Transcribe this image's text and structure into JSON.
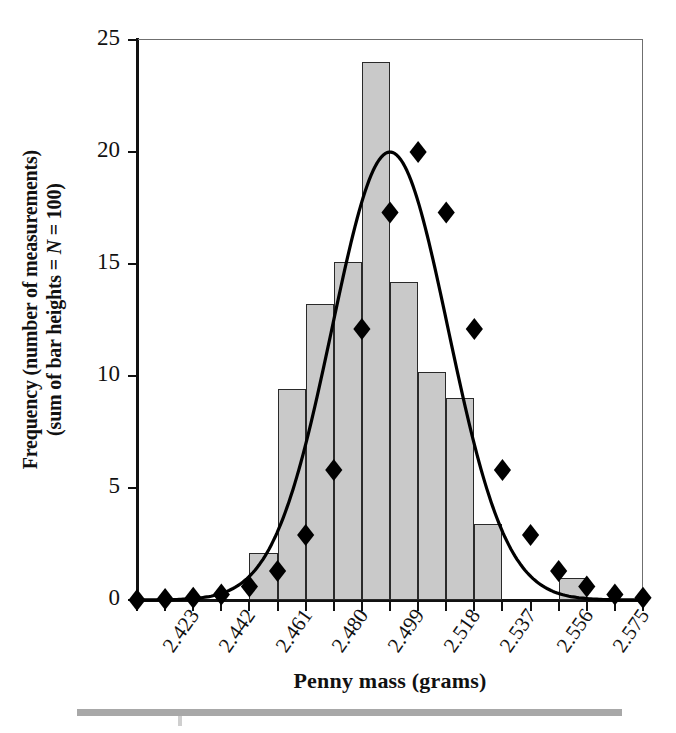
{
  "chart_data": {
    "type": "bar",
    "title": "",
    "xlabel": "Penny mass (grams)",
    "ylabel_line1": "Frequency (number of measurements)",
    "ylabel_line2_a": "(sum of bar heights = ",
    "ylabel_line2_italic": "N",
    "ylabel_line2_b": " = 100)",
    "ylabel_full": "Frequency (number of measurements) (sum of bar heights = N = 100)",
    "xtick_labels": [
      "2.423",
      "2.442",
      "2.461",
      "2.480",
      "2.499",
      "2.518",
      "2.537",
      "2.556",
      "2.575"
    ],
    "xtick_values": [
      2.423,
      2.442,
      2.461,
      2.48,
      2.499,
      2.518,
      2.537,
      2.556,
      2.575
    ],
    "ytick_labels": [
      "0",
      "5",
      "10",
      "15",
      "20",
      "25"
    ],
    "ytick_values": [
      0,
      5,
      10,
      15,
      20,
      25
    ],
    "ylim": [
      0,
      25
    ],
    "xlim": [
      2.4135,
      2.5845
    ],
    "bin_width": 0.0095,
    "grid": false,
    "legend": false,
    "bar_fill_color": "#c9c9c9",
    "bar_edge_color": "#2a2a2a",
    "curve_color": "#000000",
    "marker_shape": "diamond",
    "marker_color": "#000000",
    "categories": [
      "2.4230-2.4325",
      "2.4325-2.4420",
      "2.4420-2.4515",
      "2.4515-2.4610",
      "2.4610-2.4705",
      "2.4705-2.4800",
      "2.4800-2.4895",
      "2.4895-2.4990",
      "2.4990-2.5085",
      "2.5085-2.5180",
      "2.5180-2.5275",
      "2.5275-2.5370",
      "2.5370-2.5465",
      "2.5465-2.5560",
      "2.5560-2.5655",
      "2.5655-2.5750"
    ],
    "values": [
      0,
      0,
      0,
      2.1,
      9.4,
      13.2,
      15.1,
      24.0,
      14.2,
      10.2,
      9.0,
      3.4,
      0,
      0,
      1.0,
      0
    ],
    "series": [
      {
        "name": "Histogram (measured frequency)",
        "type": "bar",
        "values": [
          0,
          0,
          0,
          2.1,
          9.4,
          13.2,
          15.1,
          24.0,
          14.2,
          10.2,
          9.0,
          3.4,
          0,
          0,
          1.0,
          0
        ]
      },
      {
        "name": "Gaussian curve",
        "type": "line",
        "x": [
          2.4135,
          2.423,
          2.4325,
          2.442,
          2.4515,
          2.461,
          2.4705,
          2.48,
          2.4895,
          2.499,
          2.5085,
          2.518,
          2.5275,
          2.537,
          2.5465,
          2.556,
          2.5655,
          2.575,
          2.5845
        ],
        "values": [
          0.0,
          0.05,
          0.1,
          0.25,
          0.6,
          1.3,
          2.9,
          5.8,
          12.1,
          17.3,
          20.0,
          17.3,
          12.1,
          5.8,
          2.9,
          1.3,
          0.6,
          0.25,
          0.1
        ]
      }
    ]
  },
  "footer": {
    "rule": ""
  }
}
